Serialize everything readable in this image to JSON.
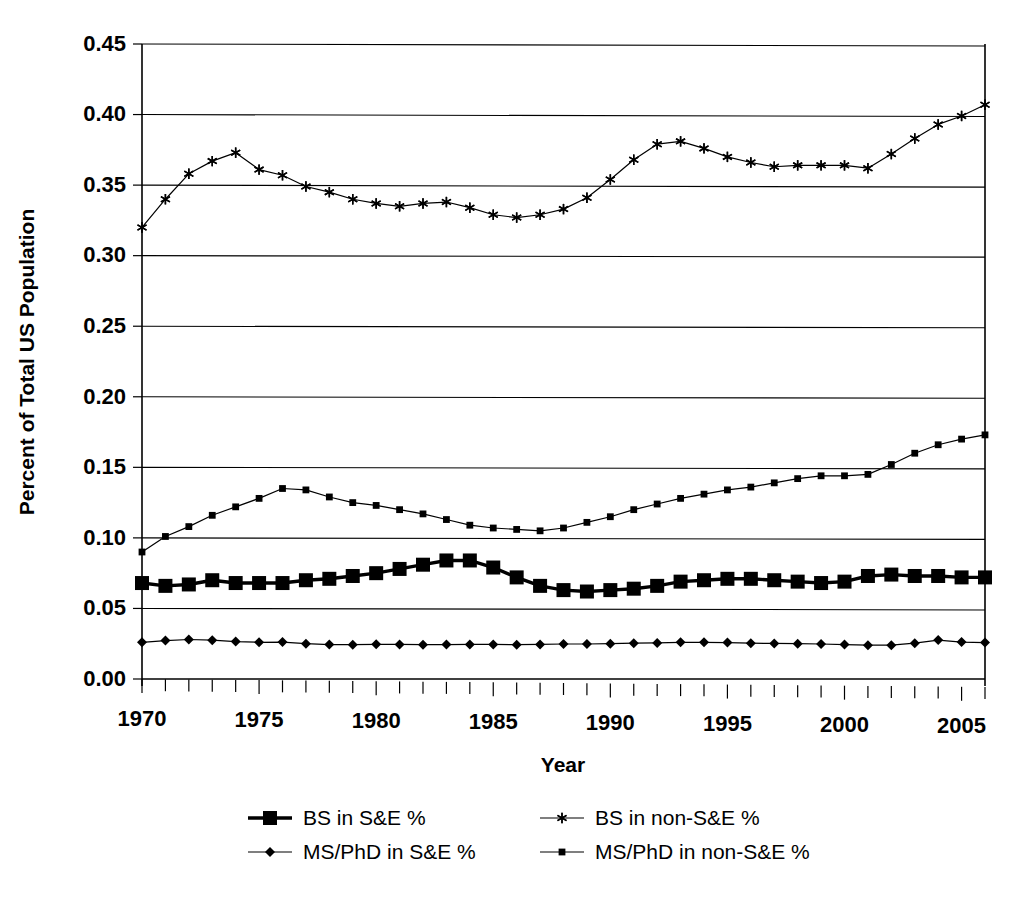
{
  "chart_data": {
    "type": "line",
    "title": "",
    "xlabel": "Year",
    "ylabel": "Percent of Total US Population",
    "xlim": [
      1970,
      2006
    ],
    "ylim": [
      0.0,
      0.45
    ],
    "grid": true,
    "legend_position": "bottom",
    "y_ticks": [
      "0.00",
      "0.05",
      "0.10",
      "0.15",
      "0.20",
      "0.25",
      "0.30",
      "0.35",
      "0.40",
      "0.45"
    ],
    "y_tick_values": [
      0.0,
      0.05,
      0.1,
      0.15,
      0.2,
      0.25,
      0.3,
      0.35,
      0.4,
      0.45
    ],
    "x_ticks": [
      "1970",
      "1975",
      "1980",
      "1985",
      "1990",
      "1995",
      "2000",
      "2005"
    ],
    "x_tick_values": [
      1970,
      1975,
      1980,
      1985,
      1990,
      1995,
      2000,
      2005
    ],
    "x_minor_step": 1,
    "x": [
      1970,
      1971,
      1972,
      1973,
      1974,
      1975,
      1976,
      1977,
      1978,
      1979,
      1980,
      1981,
      1982,
      1983,
      1984,
      1985,
      1986,
      1987,
      1988,
      1989,
      1990,
      1991,
      1992,
      1993,
      1994,
      1995,
      1996,
      1997,
      1998,
      1999,
      2000,
      2001,
      2002,
      2003,
      2004,
      2005,
      2006
    ],
    "series": [
      {
        "name": "BS in S&E %",
        "marker": "square-filled-large",
        "color": "#000000",
        "line_width": "thick",
        "values": [
          0.068,
          0.066,
          0.067,
          0.07,
          0.068,
          0.068,
          0.068,
          0.07,
          0.071,
          0.073,
          0.075,
          0.078,
          0.081,
          0.084,
          0.084,
          0.079,
          0.072,
          0.066,
          0.063,
          0.062,
          0.063,
          0.064,
          0.066,
          0.069,
          0.07,
          0.071,
          0.071,
          0.07,
          0.069,
          0.068,
          0.069,
          0.073,
          0.074,
          0.073,
          0.073,
          0.072,
          0.072
        ]
      },
      {
        "name": "BS in non-S&E %",
        "marker": "asterisk",
        "color": "#000000",
        "line_width": "thin",
        "values": [
          0.32,
          0.34,
          0.358,
          0.367,
          0.373,
          0.361,
          0.357,
          0.349,
          0.345,
          0.34,
          0.337,
          0.335,
          0.337,
          0.338,
          0.334,
          0.329,
          0.327,
          0.329,
          0.333,
          0.341,
          0.354,
          0.368,
          0.379,
          0.381,
          0.376,
          0.37,
          0.366,
          0.363,
          0.364,
          0.364,
          0.364,
          0.362,
          0.372,
          0.383,
          0.393,
          0.399,
          0.407
        ]
      },
      {
        "name": "MS/PhD in S&E %",
        "marker": "diamond",
        "color": "#000000",
        "line_width": "thin",
        "values": [
          0.026,
          0.0272,
          0.028,
          0.0275,
          0.0265,
          0.026,
          0.0262,
          0.025,
          0.0244,
          0.0243,
          0.0246,
          0.0245,
          0.0243,
          0.0244,
          0.0245,
          0.0245,
          0.0243,
          0.0245,
          0.0248,
          0.0248,
          0.025,
          0.0254,
          0.0256,
          0.026,
          0.026,
          0.0258,
          0.0254,
          0.0252,
          0.025,
          0.0248,
          0.0244,
          0.024,
          0.024,
          0.0254,
          0.0276,
          0.0262,
          0.0258
        ]
      },
      {
        "name": "MS/PhD in non-S&E %",
        "marker": "square-small",
        "color": "#000000",
        "line_width": "thin",
        "values": [
          0.09,
          0.101,
          0.108,
          0.116,
          0.122,
          0.128,
          0.135,
          0.134,
          0.129,
          0.125,
          0.123,
          0.12,
          0.117,
          0.113,
          0.109,
          0.107,
          0.106,
          0.105,
          0.107,
          0.111,
          0.115,
          0.12,
          0.124,
          0.128,
          0.131,
          0.134,
          0.136,
          0.139,
          0.142,
          0.144,
          0.144,
          0.145,
          0.152,
          0.16,
          0.166,
          0.17,
          0.173
        ]
      }
    ],
    "legend": [
      {
        "label": "BS in S&E %",
        "marker": "square-filled-large",
        "row": 0,
        "col": 0
      },
      {
        "label": "BS in non-S&E %",
        "marker": "asterisk",
        "row": 0,
        "col": 1
      },
      {
        "label": "MS/PhD in S&E %",
        "marker": "diamond",
        "row": 1,
        "col": 0
      },
      {
        "label": "MS/PhD in non-S&E %",
        "marker": "square-small",
        "row": 1,
        "col": 1
      }
    ]
  }
}
